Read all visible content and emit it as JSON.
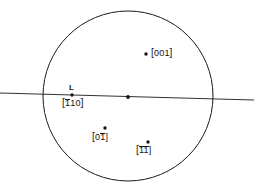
{
  "figure": {
    "type": "stereographic-projection",
    "title": "",
    "background_color": "#ffffff",
    "line_color": "#1a1a1a",
    "marker_color": "#141414"
  },
  "primitive_circle": {
    "center_x": 128,
    "center_y": 96,
    "radius": 85
  },
  "trace_line": {
    "label": "L",
    "x1": 0,
    "y1": 93,
    "x2": 254,
    "y2": 100
  },
  "poles": [
    {
      "name": "pole-001",
      "marker_x": 146,
      "marker_y": 54,
      "label_x": 151,
      "label_y": 49,
      "open_bracket": "[",
      "digits": "001",
      "close_bracket": "]",
      "overbar": "",
      "label_text": "[001]"
    },
    {
      "name": "pole-1bar10",
      "marker_x": 72,
      "marker_y": 95,
      "label_x": 62,
      "label_y": 98,
      "open_bracket": "[",
      "digits": "1",
      "digits_rest": "10",
      "close_bracket": "]",
      "overbar": "1",
      "label_text": "[110]"
    },
    {
      "name": "pole-0bar10",
      "marker_x": 105,
      "marker_y": 128,
      "label_x": 92,
      "label_y": 133,
      "open_bracket": "[",
      "digits": "0",
      "digits_rest": "10",
      "close_bracket": "]",
      "overbar": "1",
      "label_text": "[010]"
    },
    {
      "name": "pole-bar1bar10",
      "marker_x": 148,
      "marker_y": 142,
      "label_x": 136,
      "label_y": 146,
      "open_bracket": "[",
      "digits": "1",
      "digits_rest": "10",
      "close_bracket": "]",
      "overbar": "11",
      "label_text": "[110]"
    }
  ],
  "center_point": {
    "name": "projection-center",
    "x": 128,
    "y": 97
  }
}
